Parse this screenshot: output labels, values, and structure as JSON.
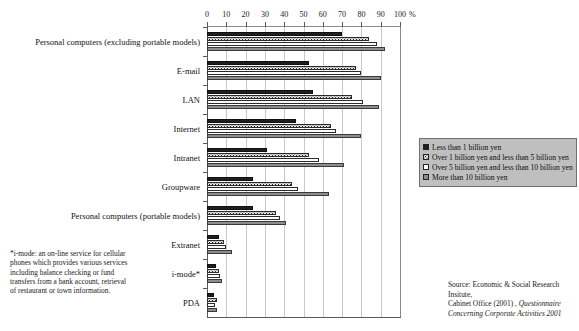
{
  "chart_data": {
    "type": "bar",
    "orientation": "horizontal",
    "title": "",
    "xlabel": "%",
    "ylabel": "",
    "xlim": [
      0,
      100
    ],
    "xticks": [
      0,
      10,
      20,
      30,
      40,
      50,
      60,
      70,
      80,
      90,
      100
    ],
    "grid": true,
    "legend_position": "right",
    "categories": [
      "Personal computers (excluding portable models)",
      "E-mail",
      "LAN",
      "Internet",
      "Intranet",
      "Groupware",
      "Personal computers (portable models)",
      "Extranet",
      "i-mode*",
      "PDA"
    ],
    "series": [
      {
        "name": "Less than 1 billion yen",
        "color": "#201f1f",
        "pattern": "solid-black",
        "values": [
          70,
          53,
          55,
          46,
          31,
          24,
          24,
          6,
          4.5,
          3.5
        ]
      },
      {
        "name": "Over 1 billion yen and less than 5 billion yen",
        "color": "#e8e8e8",
        "pattern": "dotted",
        "values": [
          84,
          77,
          75,
          64,
          53,
          44,
          36,
          9,
          6,
          5
        ]
      },
      {
        "name": "Over 5 billion yen and less than 10 billion yen",
        "color": "#ffffff",
        "pattern": "white",
        "values": [
          88,
          80,
          81,
          67,
          58,
          47,
          38,
          10,
          6.5,
          4
        ]
      },
      {
        "name": "More than 10 billion yen",
        "color": "#8d8d8d",
        "pattern": "gray",
        "values": [
          92,
          90,
          89,
          80,
          71,
          63,
          41,
          13,
          8,
          5
        ]
      }
    ]
  },
  "axis": {
    "x_unit_label": "%",
    "tick_labels": [
      "0",
      "10",
      "20",
      "30",
      "40",
      "50",
      "60",
      "70",
      "80",
      "90",
      "100"
    ]
  },
  "legend": {
    "items": [
      "Less than 1 billion yen",
      "Over 1 billion yen and less than 5 billion yen",
      "Over 5 billion yen and less than 10 billion yen",
      "More than 10 billion yen"
    ]
  },
  "footnote": {
    "text": "*i-mode: an on-line service for cellular phones which provides various services including balance checking or fund transfers from a bank account, retrieval of restaurant or town information."
  },
  "source": {
    "line1": "Source: Economic & Social Research Insitute,",
    "line2_prefix": "Cabinet Office (2001) , ",
    "line2_italic": "Questionnaire",
    "line3_italic": "Concerning Corporate Activities 2001"
  },
  "top_strip": {
    "text": ""
  }
}
